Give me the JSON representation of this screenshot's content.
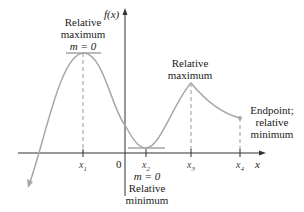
{
  "axes": {
    "y_label": "f(x)",
    "x_label": "x",
    "origin_label": "0"
  },
  "ticks": {
    "x1": "x",
    "x1_sub": "1",
    "x2": "x",
    "x2_sub": "2",
    "x3": "x",
    "x3_sub": "3",
    "x4": "x",
    "x4_sub": "4"
  },
  "annotations": {
    "rel_max_1_line1": "Relative",
    "rel_max_1_line2": "maximum",
    "rel_max_1_slope": "m = 0",
    "rel_min_slope": "m = 0",
    "rel_min_line1": "Relative",
    "rel_min_line2": "minimum",
    "rel_max_2_line1": "Relative",
    "rel_max_2_line2": "maximum",
    "endpoint_line1": "Endpoint;",
    "endpoint_line2": "relative",
    "endpoint_line3": "minimum"
  },
  "colors": {
    "curve": "#a8a8a8",
    "axis": "#333333",
    "dashed": "#9a9a9a",
    "text": "#222222"
  }
}
